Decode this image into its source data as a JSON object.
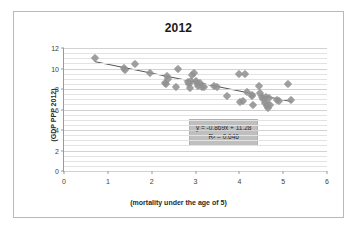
{
  "chart_data": {
    "type": "scatter",
    "title": "2012",
    "xlabel": "(mortality under the age of 5)",
    "ylabel": "(GDP PPP 2012)",
    "xlim": [
      0,
      6
    ],
    "ylim": [
      0,
      12
    ],
    "xticks": [
      0,
      1,
      2,
      3,
      4,
      5,
      6
    ],
    "yticks": [
      0,
      2,
      4,
      6,
      8,
      10,
      12
    ],
    "grid": "horizontal-minor-and-major",
    "minor_y_step": 0.5,
    "legend": "none",
    "marker": "diamond",
    "marker_color": "#929292",
    "trendline": {
      "type": "linear",
      "color": "#555555",
      "equation": "y = -0.869x + 11.28",
      "r_squared_label": "R² = 0.646",
      "slope": -0.869,
      "intercept": 11.28,
      "r_squared": 0.646,
      "x_start": 0.7,
      "x_end": 5.2
    },
    "points": [
      {
        "x": 0.7,
        "y": 11.05
      },
      {
        "x": 1.37,
        "y": 10.05
      },
      {
        "x": 1.4,
        "y": 9.9
      },
      {
        "x": 1.62,
        "y": 10.4
      },
      {
        "x": 1.96,
        "y": 9.52
      },
      {
        "x": 2.3,
        "y": 8.6
      },
      {
        "x": 2.33,
        "y": 8.52
      },
      {
        "x": 2.35,
        "y": 9.22
      },
      {
        "x": 2.38,
        "y": 8.95
      },
      {
        "x": 2.56,
        "y": 8.22
      },
      {
        "x": 2.6,
        "y": 9.98
      },
      {
        "x": 2.82,
        "y": 8.7
      },
      {
        "x": 2.86,
        "y": 8.45
      },
      {
        "x": 2.88,
        "y": 8.05
      },
      {
        "x": 2.9,
        "y": 8.82
      },
      {
        "x": 2.93,
        "y": 9.35
      },
      {
        "x": 2.96,
        "y": 9.52
      },
      {
        "x": 3.0,
        "y": 8.78
      },
      {
        "x": 3.03,
        "y": 8.6
      },
      {
        "x": 3.06,
        "y": 8.25
      },
      {
        "x": 3.1,
        "y": 8.55
      },
      {
        "x": 3.14,
        "y": 8.18
      },
      {
        "x": 3.2,
        "y": 8.22
      },
      {
        "x": 3.42,
        "y": 8.28
      },
      {
        "x": 3.48,
        "y": 8.18
      },
      {
        "x": 3.72,
        "y": 7.3
      },
      {
        "x": 3.99,
        "y": 9.48
      },
      {
        "x": 4.12,
        "y": 9.45
      },
      {
        "x": 4.02,
        "y": 6.72
      },
      {
        "x": 4.08,
        "y": 6.82
      },
      {
        "x": 4.18,
        "y": 7.72
      },
      {
        "x": 4.28,
        "y": 7.38
      },
      {
        "x": 4.3,
        "y": 7.28
      },
      {
        "x": 4.32,
        "y": 6.42
      },
      {
        "x": 4.45,
        "y": 8.32
      },
      {
        "x": 4.48,
        "y": 7.58
      },
      {
        "x": 4.52,
        "y": 7.22
      },
      {
        "x": 4.55,
        "y": 6.98
      },
      {
        "x": 4.58,
        "y": 6.62
      },
      {
        "x": 4.6,
        "y": 7.25
      },
      {
        "x": 4.62,
        "y": 6.35
      },
      {
        "x": 4.64,
        "y": 6.55
      },
      {
        "x": 4.66,
        "y": 6.15
      },
      {
        "x": 4.68,
        "y": 7.1
      },
      {
        "x": 4.7,
        "y": 6.4
      },
      {
        "x": 4.86,
        "y": 6.88
      },
      {
        "x": 4.9,
        "y": 6.85
      },
      {
        "x": 5.1,
        "y": 8.45
      },
      {
        "x": 5.18,
        "y": 6.95
      }
    ]
  }
}
